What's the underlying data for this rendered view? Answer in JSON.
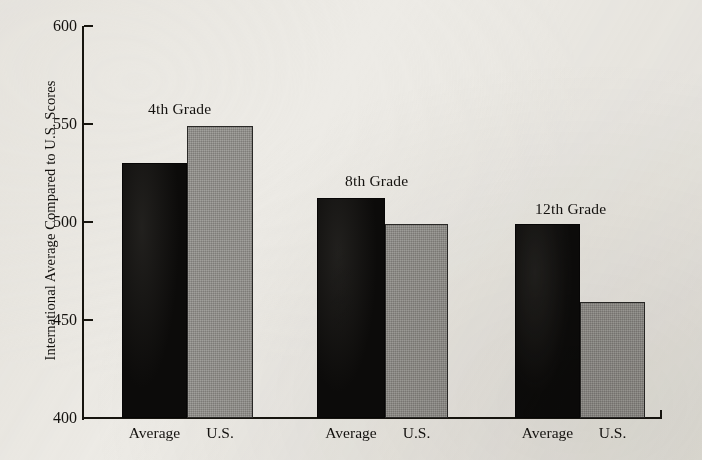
{
  "chart_data": {
    "type": "bar",
    "title": "",
    "xlabel": "",
    "ylabel": "International Average Compared to U.S. Scores",
    "ylim": [
      400,
      600
    ],
    "ytick_labels": [
      "600",
      "550",
      "500",
      "450",
      "400"
    ],
    "ytick_values": [
      600,
      550,
      500,
      450,
      400
    ],
    "grid": false,
    "legend_position": "none",
    "categories": [
      "4th Grade",
      "8th Grade",
      "12th Grade"
    ],
    "subcategories": [
      "Average",
      "U.S."
    ],
    "series": [
      {
        "name": "Average",
        "values": [
          530,
          512,
          499
        ],
        "color": "#0c0b0a"
      },
      {
        "name": "U.S.",
        "values": [
          549,
          499,
          459
        ],
        "color": "#8d8b87"
      }
    ],
    "groups": [
      {
        "label": "4th Grade",
        "bars": [
          {
            "label": "Average",
            "value": 530,
            "style": "dark"
          },
          {
            "label": "U.S.",
            "value": 549,
            "style": "light"
          }
        ]
      },
      {
        "label": "8th Grade",
        "bars": [
          {
            "label": "Average",
            "value": 512,
            "style": "dark"
          },
          {
            "label": "U.S.",
            "value": 499,
            "style": "light"
          }
        ]
      },
      {
        "label": "12th Grade",
        "bars": [
          {
            "label": "Average",
            "value": 499,
            "style": "dark"
          },
          {
            "label": "U.S.",
            "value": 459,
            "style": "light"
          }
        ]
      }
    ]
  },
  "axis": {
    "y_title": "International Average Compared to U.S. Scores",
    "y_ticks": [
      {
        "label": "600",
        "value": 600
      },
      {
        "label": "550",
        "value": 550
      },
      {
        "label": "500",
        "value": 500
      },
      {
        "label": "450",
        "value": 450
      },
      {
        "label": "400",
        "value": 400
      }
    ]
  },
  "x_tick_labels": [
    "Average",
    "U.S.",
    "Average",
    "U.S.",
    "Average",
    "U.S."
  ],
  "group_titles": [
    "4th Grade",
    "8th Grade",
    "12th Grade"
  ],
  "colors": {
    "background": "#edebe6",
    "ink": "#14120f",
    "bar_dark": "#0c0b0a",
    "bar_light": "#8d8b87"
  }
}
